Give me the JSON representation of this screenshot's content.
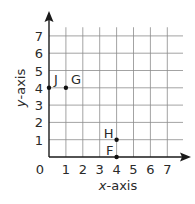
{
  "chart_data": {
    "type": "scatter",
    "title": "",
    "xlabel": "x-axis",
    "ylabel": "y-axis",
    "xlim": [
      0,
      7
    ],
    "ylim": [
      0,
      7
    ],
    "grid": true,
    "x_ticks": [
      "0",
      "1",
      "2",
      "3",
      "4",
      "5",
      "6",
      "7"
    ],
    "y_ticks": [
      "1",
      "2",
      "3",
      "4",
      "5",
      "6",
      "7"
    ],
    "points": [
      {
        "label": "J",
        "x": 0,
        "y": 4
      },
      {
        "label": "G",
        "x": 1,
        "y": 4
      },
      {
        "label": "H",
        "x": 4,
        "y": 1
      },
      {
        "label": "F",
        "x": 4,
        "y": 0
      }
    ]
  },
  "labels": {
    "origin": "0",
    "x_axis_var": "x",
    "x_axis_rest": "-axis",
    "y_axis_var": "y",
    "y_axis_rest": "-axis"
  },
  "colors": {
    "axis": "#1a1a1a",
    "grid": "#8c8c8c",
    "text": "#2a2a2a",
    "point": "#111111"
  }
}
